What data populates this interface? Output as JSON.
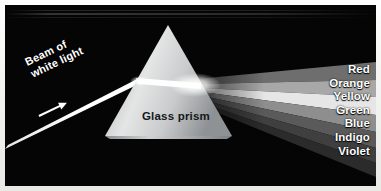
{
  "figure": {
    "background_color": "#050505",
    "frame_color": "#f4f4f2"
  },
  "prism": {
    "label": "Glass prism",
    "label_color": "#15181a"
  },
  "incident_beam": {
    "label_line1": "Beam of",
    "label_line2": "white light",
    "label_color": "#ffffff",
    "arrow_icon": "arrow-right-icon",
    "beam_color": "#ffffff"
  },
  "spectrum": {
    "bands": [
      {
        "name": "Red",
        "label": "Red",
        "gray": "#6e6e6e"
      },
      {
        "name": "Orange",
        "label": "Orange",
        "gray": "#a8a8a8"
      },
      {
        "name": "Yellow",
        "label": "Yellow",
        "gray": "#e6e6e6"
      },
      {
        "name": "Green",
        "label": "Green",
        "gray": "#8e8e8e"
      },
      {
        "name": "Blue",
        "label": "Blue",
        "gray": "#5a5a5a"
      },
      {
        "name": "Indigo",
        "label": "Indigo",
        "gray": "#3f3f3f"
      },
      {
        "name": "Violet",
        "label": "Violet",
        "gray": "#2b2b2b"
      }
    ],
    "label_color": "#ffffff"
  }
}
